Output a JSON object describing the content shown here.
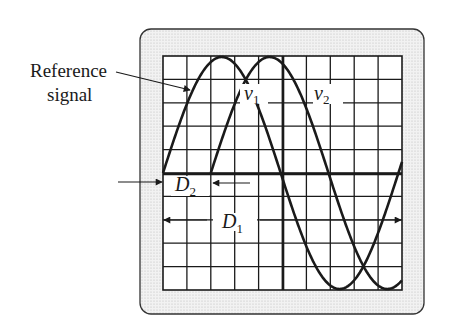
{
  "labels": {
    "reference_line1": "Reference",
    "reference_line2": "signal",
    "v1": "v",
    "v1_sub": "1",
    "v2": "v",
    "v2_sub": "2",
    "d1": "D",
    "d1_sub": "1",
    "d2": "D",
    "d2_sub": "2"
  },
  "colors": {
    "ink": "#1a1a1a",
    "bezel_fill": "#ececec",
    "screen": "#ffffff"
  },
  "chart_data": {
    "type": "line",
    "grid": {
      "cols": 10,
      "rows": 10
    },
    "series": [
      {
        "name": "v1 (Reference signal)",
        "shape": "sine",
        "start_div": 0,
        "period_div": 10
      },
      {
        "name": "v2",
        "shape": "sine",
        "start_div": 2,
        "period_div": 10
      }
    ],
    "annotations": [
      {
        "name": "D2",
        "meaning": "horizontal offset between v1 and v2",
        "span_div": 2
      },
      {
        "name": "D1",
        "meaning": "period of signal",
        "span_div": 10
      }
    ]
  }
}
